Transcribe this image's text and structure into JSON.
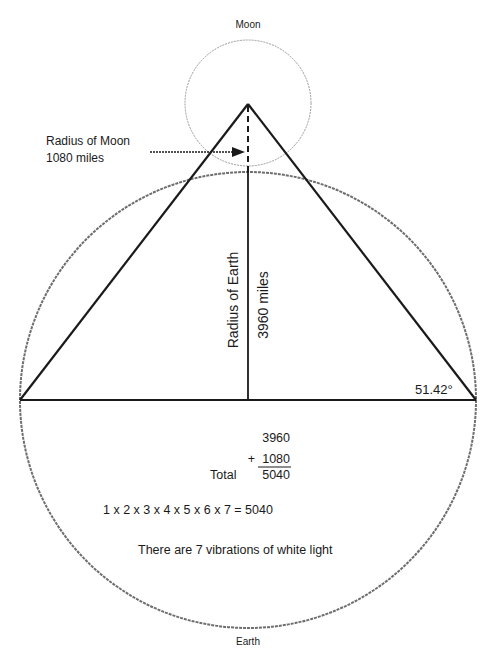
{
  "labels": {
    "moon": "Moon",
    "earth": "Earth",
    "radius_moon_title": "Radius of Moon",
    "radius_moon_value": "1080 miles",
    "radius_earth": "Radius of Earth",
    "earth_radius_value": "3960 miles",
    "angle": "51.42°"
  },
  "sum": {
    "addend1": "3960",
    "addend2": "1080",
    "plus": "+",
    "total_label": "Total",
    "total": "5040"
  },
  "factorial_equation": "1 x 2 x 3 x 4 x 5 x 6 x 7 = 5040",
  "caption": "There are 7 vibrations of white light",
  "colors": {
    "ink": "#1a1a1a",
    "circle": "#7a7a7a"
  }
}
